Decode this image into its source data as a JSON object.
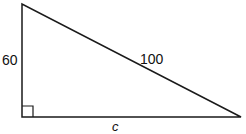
{
  "diagram": {
    "type": "right-triangle",
    "labels": {
      "vertical_leg": "60",
      "hypotenuse": "100",
      "horizontal_leg": "c"
    },
    "vertices": {
      "top": [
        22,
        4
      ],
      "right_angle": [
        22,
        117
      ],
      "right": [
        241,
        117
      ]
    },
    "right_angle_marker_size": 11,
    "colors": {
      "stroke": "#1a1a1a",
      "text": "#111111",
      "background": "#ffffff"
    }
  }
}
